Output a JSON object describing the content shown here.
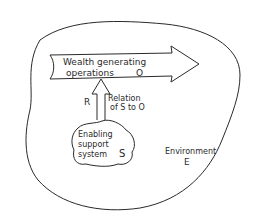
{
  "diagram": {
    "environment": {
      "label": "Environment",
      "symbol": "E"
    },
    "operations": {
      "label_line1": "Wealth generating",
      "label_line2": "operations",
      "symbol": "O"
    },
    "relation": {
      "symbol": "R",
      "label_line1": "Relation",
      "label_line2": "of S to O"
    },
    "support_system": {
      "label_line1": "Enabling",
      "label_line2": "support",
      "label_line3": "system",
      "symbol": "S"
    },
    "colors": {
      "ink": "#2a2a2a",
      "background": "#ffffff"
    }
  }
}
